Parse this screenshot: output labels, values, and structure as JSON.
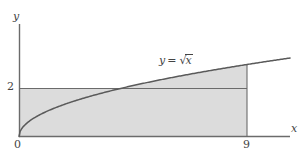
{
  "figure": {
    "title": "",
    "background_color": "#ffffff",
    "axis_color": "#6b6b6b",
    "curve_color": "#5a5a5a",
    "fill_color": "#dcdcdc",
    "text_color": "#444444"
  },
  "labels": {
    "y_axis": "y",
    "x_axis": "x",
    "origin": "0",
    "tick_2": "2",
    "tick_9": "9",
    "curve_equation_lhs": "y",
    "curve_equation_eq": "=",
    "curve_equation_radical_sign": "√",
    "curve_equation_radical_arg": "x"
  },
  "chart_data": {
    "type": "line",
    "title": "",
    "xlabel": "x",
    "ylabel": "y",
    "xlim": [
      0,
      10.7
    ],
    "ylim": [
      0,
      4.65
    ],
    "grid": false,
    "legend": "none",
    "annotations": [
      {
        "text": "y = √x",
        "x": 5.6,
        "y": 3.45
      }
    ],
    "x_ticks": [
      {
        "value": 0,
        "label": "0"
      },
      {
        "value": 9,
        "label": "9"
      }
    ],
    "y_ticks": [
      {
        "value": 0,
        "label": "0"
      },
      {
        "value": 2,
        "label": "2"
      }
    ],
    "series": [
      {
        "name": "y = √x",
        "expression": "sqrt(x)",
        "x": [
          0,
          0.25,
          0.5,
          1,
          1.5,
          2,
          2.5,
          3,
          4,
          5,
          6,
          7,
          8,
          9,
          10,
          10.7
        ],
        "values": [
          0,
          0.5,
          0.707,
          1,
          1.225,
          1.414,
          1.581,
          1.732,
          2,
          2.236,
          2.449,
          2.646,
          2.828,
          3,
          3.162,
          3.271
        ]
      },
      {
        "name": "y = 2 (horizontal line)",
        "expression": "2",
        "x": [
          0,
          9
        ],
        "values": [
          2,
          2
        ]
      },
      {
        "name": "x = 9 (vertical line)",
        "expression": "9",
        "x": [
          9,
          9
        ],
        "values": [
          0,
          3
        ]
      }
    ],
    "shaded_regions": [
      {
        "name": "rectangle-under-y-equals-2",
        "description": "Rectangle bounded by x=0, x=9, y=0, y=2",
        "x_range": [
          0,
          9
        ],
        "y_range": [
          0,
          2
        ],
        "fill": "#dcdcdc"
      },
      {
        "name": "region-between-curve-and-line",
        "description": "Region between y=2 and y=sqrt(x) from x=4 to x=9",
        "x_range": [
          4,
          9
        ],
        "lower": "2",
        "upper": "sqrt(x)",
        "fill": "#dcdcdc"
      }
    ]
  }
}
